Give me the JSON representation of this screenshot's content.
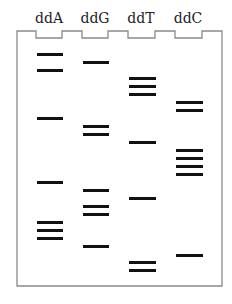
{
  "diagram": {
    "type": "sanger-sequencing-gel",
    "colors": {
      "outline": "#8a8a8a",
      "band": "#111111",
      "label": "#222222",
      "background": "#ffffff"
    },
    "frame": {
      "left": 17,
      "right": 222,
      "top": 31,
      "notch_bottom": 38,
      "bottom": 286
    },
    "lanes": [
      {
        "label": "ddA",
        "notch_x": [
          36,
          62
        ],
        "center": 49,
        "bands_y": [
          54,
          70,
          118,
          182,
          222,
          230,
          238
        ]
      },
      {
        "label": "ddG",
        "notch_x": [
          82,
          108
        ],
        "center": 95,
        "bands_y": [
          62,
          126,
          134,
          190,
          206,
          214,
          246
        ]
      },
      {
        "label": "ddT",
        "notch_x": [
          128,
          155
        ],
        "center": 141,
        "bands_y": [
          78,
          86,
          94,
          142,
          198,
          262,
          270
        ]
      },
      {
        "label": "ddC",
        "notch_x": [
          175,
          202
        ],
        "center": 188,
        "bands_y": [
          102,
          110,
          150,
          158,
          166,
          174,
          255
        ]
      }
    ]
  }
}
